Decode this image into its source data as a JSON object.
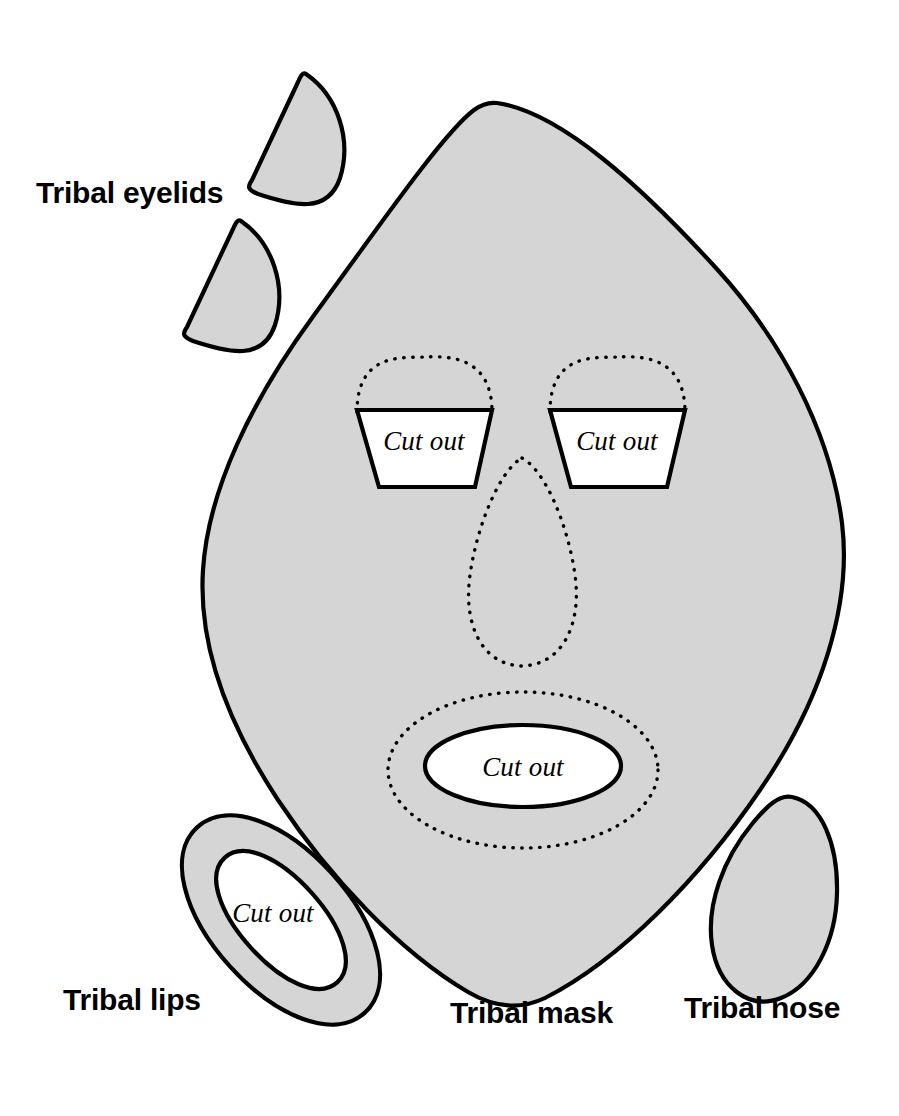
{
  "page": {
    "background_color": "#ffffff",
    "shape_fill_color": "#d5d5d5",
    "outline_color": "#000000",
    "cutout_fill_color": "#ffffff"
  },
  "labels": {
    "eyelids": "Tribal eyelids",
    "lips": "Tribal lips",
    "mask": "Tribal mask",
    "nose": "Tribal nose"
  },
  "cutouts": {
    "left_eye": "Cut out",
    "right_eye": "Cut out",
    "mouth": "Cut out",
    "lips": "Cut out"
  },
  "parts": [
    {
      "name": "tribal-eyelid-upper",
      "kind": "half-disc",
      "count": 1
    },
    {
      "name": "tribal-eyelid-lower",
      "kind": "half-disc",
      "count": 1
    },
    {
      "name": "tribal-mask",
      "kind": "rounded-diamond",
      "count": 1
    },
    {
      "name": "tribal-lips",
      "kind": "rotated-ring",
      "count": 1
    },
    {
      "name": "tribal-nose",
      "kind": "teardrop",
      "count": 1
    }
  ],
  "guides": [
    {
      "name": "left-eye-arc-guide",
      "style": "dotted"
    },
    {
      "name": "right-eye-arc-guide",
      "style": "dotted"
    },
    {
      "name": "nose-teardrop-guide",
      "style": "dotted"
    },
    {
      "name": "mouth-ellipse-guide",
      "style": "dotted"
    }
  ]
}
